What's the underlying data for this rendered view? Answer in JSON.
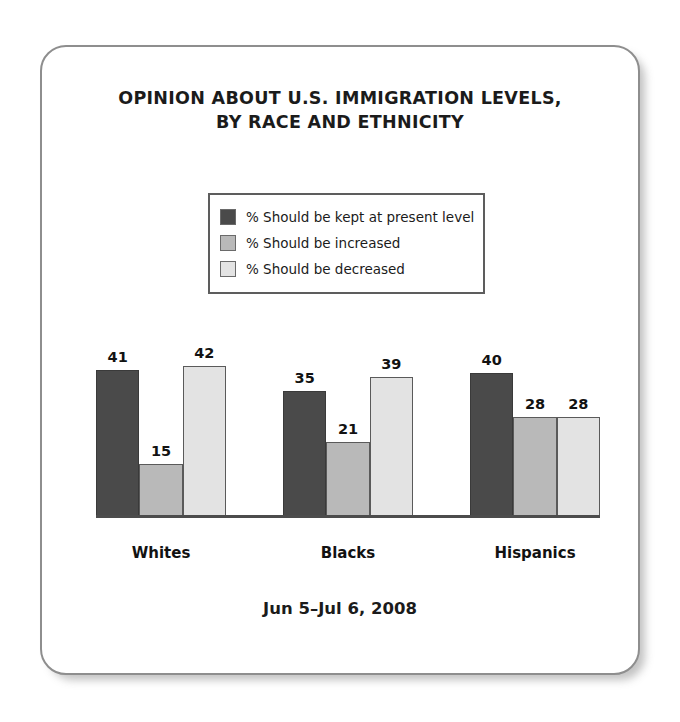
{
  "card": {
    "title_line1": "OPINION ABOUT U.S. IMMIGRATION LEVELS,",
    "title_line2": "BY RACE AND ETHNICITY",
    "footer": "Jun 5–Jul 6, 2008"
  },
  "legend": {
    "items": [
      {
        "label": "% Should be kept at present level",
        "color": "#4a4a4a"
      },
      {
        "label": "% Should be increased",
        "color": "#b9b9b9"
      },
      {
        "label": "% Should be decreased",
        "color": "#e3e3e3"
      }
    ]
  },
  "chart_data": {
    "type": "bar",
    "title": "OPINION ABOUT U.S. IMMIGRATION LEVELS, BY RACE AND ETHNICITY",
    "subtitle": "Jun 5–Jul 6, 2008",
    "xlabel": "",
    "ylabel": "",
    "ylim": [
      0,
      50
    ],
    "grid": false,
    "legend_position": "top-center",
    "categories": [
      "Whites",
      "Blacks",
      "Hispanics"
    ],
    "series": [
      {
        "name": "% Should be kept at present level",
        "color": "#4a4a4a",
        "values": [
          41,
          35,
          40
        ]
      },
      {
        "name": "% Should be increased",
        "color": "#b9b9b9",
        "values": [
          15,
          21,
          28
        ]
      },
      {
        "name": "% Should be decreased",
        "color": "#e3e3e3",
        "values": [
          42,
          39,
          28
        ]
      }
    ]
  }
}
